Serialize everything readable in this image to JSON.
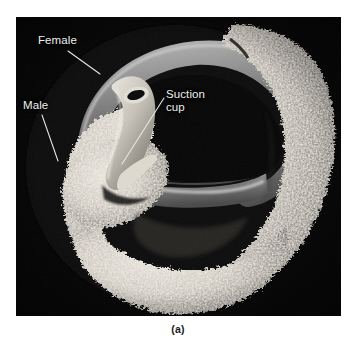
{
  "figure": {
    "caption": "(a)",
    "panel_background": "#050505",
    "page_background": "#ffffff",
    "image_type": "scanning electron micrograph",
    "panel": {
      "left": 16,
      "top": 17,
      "width": 325,
      "height": 299
    }
  },
  "annotations": {
    "label_color": "#efefef",
    "leader_color": "#e8e8e8",
    "items": [
      {
        "id": "female",
        "label": "Female",
        "lines": [
          "Female"
        ],
        "label_x": 22,
        "label_y": 17,
        "leader_from_x": 52,
        "leader_from_y": 34,
        "leader_to_x": 84,
        "leader_to_y": 57
      },
      {
        "id": "male",
        "label": "Male",
        "lines": [
          "Male"
        ],
        "label_x": 7,
        "label_y": 82,
        "leader_from_x": 26,
        "leader_from_y": 98,
        "leader_to_x": 42,
        "leader_to_y": 144
      },
      {
        "id": "suction-cup",
        "label": "Suction cup",
        "lines": [
          "Suction",
          "cup"
        ],
        "label_x": 150,
        "label_y": 71,
        "leader_from_x": 148,
        "leader_from_y": 81,
        "leader_to_x": 106,
        "leader_to_y": 147
      }
    ]
  },
  "specimen": {
    "female_tone": "#9a9a9a",
    "male_tone": "#cfcac2",
    "shadow_tone": "#1d1d1d",
    "parts": [
      "female body (smooth ribbon)",
      "male body (papillate, textured)",
      "suction cup (anterior sucker)"
    ]
  }
}
